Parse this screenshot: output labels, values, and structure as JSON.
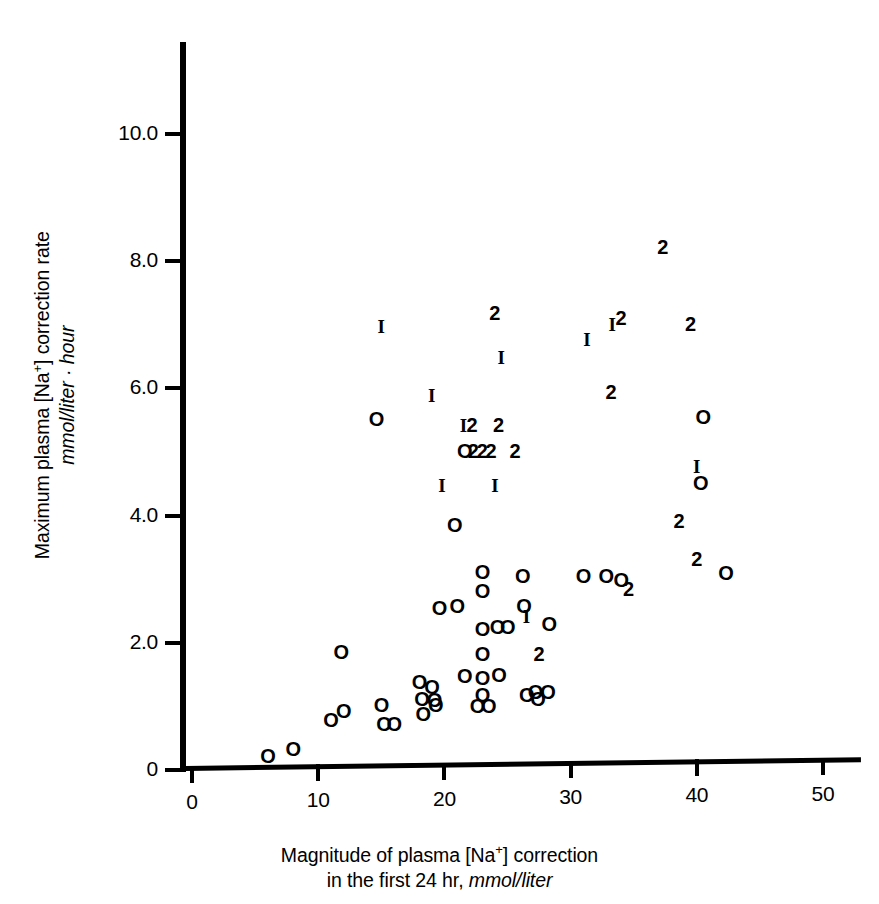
{
  "chart_data": {
    "type": "scatter",
    "title": "",
    "xlabel_line1": "Magnitude of plasma [Na",
    "xlabel_sup": "+",
    "xlabel_line1b": "] correction",
    "xlabel_line2a": "in the first 24 hr, ",
    "xlabel_line2b": "mmol/liter",
    "ylabel_line1a": "Maximum plasma [Na",
    "ylabel_sup": "+",
    "ylabel_line1b": "] correction rate",
    "ylabel_line2": "mmol/liter · hour",
    "xlim": [
      0,
      53
    ],
    "ylim": [
      0,
      11.4
    ],
    "xticks": [
      "0",
      "10",
      "20",
      "30",
      "40",
      "50"
    ],
    "xtick_values": [
      0,
      10,
      20,
      30,
      40,
      50
    ],
    "yticks": [
      "0",
      "2.0",
      "4.0",
      "6.0",
      "8.0",
      "10.0"
    ],
    "ytick_values": [
      0,
      2.0,
      4.0,
      6.0,
      8.0,
      10.0
    ],
    "grid": false,
    "legend": "none",
    "marker_encoding": {
      "O": "one observation",
      "1": "one observation (stroke glyph)",
      "2": "two coincident observations"
    },
    "points": [
      {
        "x": 6.0,
        "y": 0.22,
        "label": "O"
      },
      {
        "x": 8.0,
        "y": 0.33,
        "label": "O"
      },
      {
        "x": 11.0,
        "y": 0.78,
        "label": "O"
      },
      {
        "x": 12.0,
        "y": 0.92,
        "label": "O"
      },
      {
        "x": 11.8,
        "y": 1.85,
        "label": "O"
      },
      {
        "x": 14.6,
        "y": 5.52,
        "label": "O"
      },
      {
        "x": 15.0,
        "y": 6.98,
        "label": "1"
      },
      {
        "x": 15.0,
        "y": 1.02,
        "label": "O"
      },
      {
        "x": 15.2,
        "y": 0.72,
        "label": "O"
      },
      {
        "x": 16.0,
        "y": 0.73,
        "label": "O"
      },
      {
        "x": 18.0,
        "y": 1.38,
        "label": "O"
      },
      {
        "x": 18.2,
        "y": 1.12,
        "label": "O"
      },
      {
        "x": 18.3,
        "y": 0.88,
        "label": "O"
      },
      {
        "x": 19.0,
        "y": 1.3,
        "label": "O"
      },
      {
        "x": 19.2,
        "y": 1.1,
        "label": "O"
      },
      {
        "x": 19.3,
        "y": 1.02,
        "label": "O"
      },
      {
        "x": 19.0,
        "y": 5.9,
        "label": "1"
      },
      {
        "x": 19.6,
        "y": 2.55,
        "label": "O"
      },
      {
        "x": 19.8,
        "y": 4.48,
        "label": "1"
      },
      {
        "x": 20.8,
        "y": 3.85,
        "label": "O"
      },
      {
        "x": 21.0,
        "y": 2.58,
        "label": "O"
      },
      {
        "x": 21.6,
        "y": 1.48,
        "label": "O"
      },
      {
        "x": 21.5,
        "y": 5.42,
        "label": "1"
      },
      {
        "x": 22.2,
        "y": 5.42,
        "label": "2"
      },
      {
        "x": 21.6,
        "y": 5.02,
        "label": "O"
      },
      {
        "x": 22.3,
        "y": 5.02,
        "label": "2"
      },
      {
        "x": 23.0,
        "y": 5.02,
        "label": "2"
      },
      {
        "x": 23.7,
        "y": 5.02,
        "label": "2"
      },
      {
        "x": 23.0,
        "y": 3.12,
        "label": "O"
      },
      {
        "x": 23.0,
        "y": 2.82,
        "label": "O"
      },
      {
        "x": 23.0,
        "y": 2.22,
        "label": "O"
      },
      {
        "x": 23.0,
        "y": 1.82,
        "label": "O"
      },
      {
        "x": 23.0,
        "y": 1.45,
        "label": "O"
      },
      {
        "x": 23.0,
        "y": 1.18,
        "label": "O"
      },
      {
        "x": 22.6,
        "y": 1.0,
        "label": "O"
      },
      {
        "x": 23.5,
        "y": 1.0,
        "label": "O"
      },
      {
        "x": 24.2,
        "y": 2.25,
        "label": "O"
      },
      {
        "x": 24.3,
        "y": 1.5,
        "label": "O"
      },
      {
        "x": 24.5,
        "y": 6.5,
        "label": "1"
      },
      {
        "x": 24.0,
        "y": 7.18,
        "label": "2"
      },
      {
        "x": 24.3,
        "y": 5.42,
        "label": "2"
      },
      {
        "x": 24.0,
        "y": 4.48,
        "label": "1"
      },
      {
        "x": 25.0,
        "y": 2.25,
        "label": "O"
      },
      {
        "x": 25.6,
        "y": 5.02,
        "label": "2"
      },
      {
        "x": 26.2,
        "y": 3.05,
        "label": "O"
      },
      {
        "x": 26.3,
        "y": 2.58,
        "label": "O"
      },
      {
        "x": 26.5,
        "y": 2.42,
        "label": "1"
      },
      {
        "x": 26.5,
        "y": 1.18,
        "label": "O"
      },
      {
        "x": 27.2,
        "y": 1.22,
        "label": "O"
      },
      {
        "x": 27.4,
        "y": 1.12,
        "label": "O"
      },
      {
        "x": 27.5,
        "y": 1.82,
        "label": "2"
      },
      {
        "x": 28.2,
        "y": 1.22,
        "label": "O"
      },
      {
        "x": 28.3,
        "y": 2.3,
        "label": "O"
      },
      {
        "x": 31.0,
        "y": 3.05,
        "label": "O"
      },
      {
        "x": 31.3,
        "y": 6.78,
        "label": "1"
      },
      {
        "x": 32.8,
        "y": 3.05,
        "label": "O"
      },
      {
        "x": 33.2,
        "y": 5.95,
        "label": "2"
      },
      {
        "x": 33.3,
        "y": 7.02,
        "label": "1"
      },
      {
        "x": 34.0,
        "y": 7.1,
        "label": "2"
      },
      {
        "x": 34.0,
        "y": 2.98,
        "label": "O"
      },
      {
        "x": 34.6,
        "y": 2.85,
        "label": "2"
      },
      {
        "x": 37.3,
        "y": 8.22,
        "label": "2"
      },
      {
        "x": 38.6,
        "y": 3.92,
        "label": "2"
      },
      {
        "x": 39.5,
        "y": 7.02,
        "label": "2"
      },
      {
        "x": 40.0,
        "y": 3.32,
        "label": "2"
      },
      {
        "x": 40.0,
        "y": 4.78,
        "label": "1"
      },
      {
        "x": 40.3,
        "y": 4.52,
        "label": "O"
      },
      {
        "x": 40.5,
        "y": 5.55,
        "label": "O"
      },
      {
        "x": 42.3,
        "y": 3.1,
        "label": "O"
      }
    ]
  },
  "axes": {
    "y_tick_labels": [
      "10.0",
      "8.0",
      "6.0",
      "4.0",
      "2.0",
      "0"
    ],
    "x_tick_labels": [
      "0",
      "10",
      "20",
      "30",
      "40",
      "50"
    ]
  }
}
